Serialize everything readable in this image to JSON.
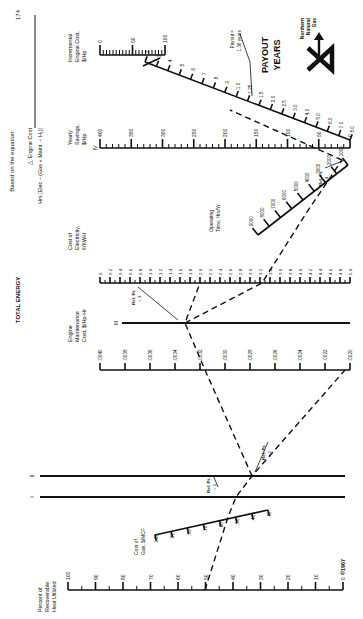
{
  "page": {
    "header_left": "174",
    "header_center": "TOTAL ENERGY",
    "equation_prefix": "Based on the equation:",
    "equation_numerator": "△ Engine Cost",
    "equation_denominator": "Hrs [Elec − (Gas + Maint. − H₁)]",
    "copyright": "©1967",
    "logo": {
      "company_lines": [
        "Northern",
        "Natural",
        "Gas"
      ],
      "letter": "N"
    },
    "payout_title_lines": [
      "PAYOUT",
      "YEARS"
    ],
    "payout_annotation_lines": [
      "Payout =",
      "1.36 years"
    ]
  },
  "scales": {
    "incremental_engine_cost": {
      "label_lines": [
        "Incremental",
        "Engine Cost,",
        "$/Hp"
      ],
      "ticks": [
        "0",
        "50",
        "100"
      ]
    },
    "payout_years": {
      "ticks": [
        ".2",
        ".3",
        ".4",
        ".5",
        ".6",
        ".7",
        ".8",
        ".9",
        "1.0",
        "1.25",
        "1.5",
        "2.0",
        "2.5",
        "3.0",
        "4.0",
        "5.0",
        "6.0",
        "7.0",
        "8.0"
      ]
    },
    "yearly_savings": {
      "label_lines": [
        "Yearly",
        "Savings,",
        "$/Hp"
      ],
      "roman": "IV",
      "ticks": [
        "400",
        "350",
        "300",
        "250",
        "200",
        "150",
        "100",
        "50",
        "0"
      ]
    },
    "operating_time": {
      "label_lines": [
        "Operating",
        "Time, Hrs/Yr"
      ],
      "ticks": [
        "9000",
        "8000",
        "7000",
        "6000",
        "5000",
        "4000",
        "3000",
        "2000",
        "1000"
      ]
    },
    "cost_of_electricity": {
      "label_lines": [
        "Cost of",
        "Electricity,",
        "¢/KWH"
      ],
      "ticks": [
        "0",
        "0.2",
        "0.4",
        "0.6",
        "0.8",
        "1.0",
        "1.2",
        "1.4",
        "1.6",
        "1.8",
        "2.0",
        "2.2",
        "2.4",
        "2.6",
        "2.8",
        "3.0",
        "3.2",
        "3.4",
        "3.6",
        "3.8",
        "4.0",
        "4.2",
        "4.4",
        "4.6",
        "4.8",
        "5.0"
      ]
    },
    "engine_maintenance_cost": {
      "label_lines": [
        "Engine",
        "Maintenance",
        "Cost, $/Hp-Hr"
      ],
      "ticks": [
        ".0040",
        ".0038",
        ".0036",
        ".0034",
        ".0032",
        ".0030",
        ".0028",
        ".0026",
        ".0024",
        ".0022",
        ".0020"
      ]
    },
    "cost_of_gas": {
      "label_lines": [
        "Cost of",
        "Gas, $/MCF"
      ],
      "ticks": [
        "1.00",
        ".90",
        ".80",
        ".70",
        ".60",
        ".50",
        ".40",
        ".30"
      ]
    },
    "percent_recoverable_heat": {
      "label_lines": [
        "Percent of",
        "Recoverable",
        "Heat Utilized"
      ],
      "ticks": [
        "100",
        "90",
        "80",
        "70",
        "60",
        "50",
        "40",
        "30",
        "20",
        "10",
        "0"
      ]
    }
  },
  "reference_lines": [
    {
      "roman": "I"
    },
    {
      "roman": "II"
    },
    {
      "roman": "III"
    }
  ],
  "reference_points": [
    {
      "label_lines": [
        "Ref. Pt.",
        "= 1"
      ]
    },
    {
      "label_lines": [
        "Ref. Pt.",
        "= 2"
      ]
    },
    {
      "label_lines": [
        "Ref. Pt.",
        "= 3"
      ]
    },
    {
      "label_lines": [
        "Ref. Pt.",
        "= 4"
      ]
    }
  ]
}
